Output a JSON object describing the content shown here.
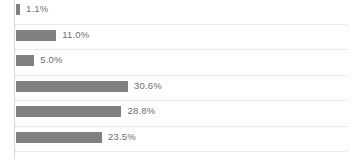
{
  "chart_data": {
    "type": "bar",
    "orientation": "horizontal",
    "title": "",
    "subtitle": "",
    "xlabel": "",
    "ylabel": "",
    "categories": [
      "",
      "",
      "",
      "",
      "",
      ""
    ],
    "values": [
      1.1,
      11.0,
      5.0,
      30.6,
      28.8,
      23.5
    ],
    "value_labels": [
      "1.1%",
      "11.0%",
      "5.0%",
      "30.6%",
      "28.8%",
      "23.5%"
    ],
    "xlim": [
      0,
      31.5
    ],
    "grid": true,
    "grid_axis": "y",
    "grid_style": "dotted",
    "legend": false,
    "legend_position": "none",
    "series": [
      {
        "name": "",
        "values": [
          1.1,
          11.0,
          5.0,
          30.6,
          28.8,
          23.5
        ]
      }
    ],
    "colors": {
      "bar": "#808080",
      "label_text": "#6e6e6e",
      "gridline": "#d6d6d6",
      "axis_line": "#d9d9d9",
      "background": "#ffffff"
    }
  }
}
